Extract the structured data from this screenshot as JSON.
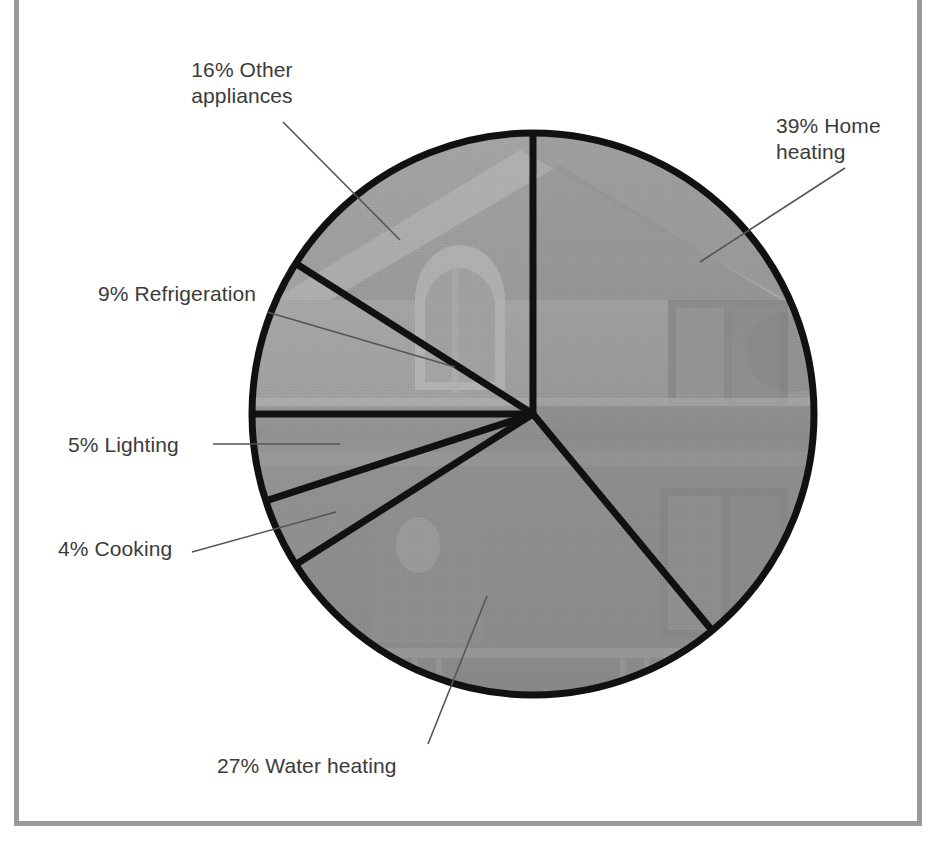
{
  "figure": {
    "background_color": "#ffffff",
    "frame_color": "#9a9a9a",
    "pie_outline_color": "#111111",
    "label_color": "#3b3b3b",
    "leader_line_color": "#555555",
    "image_fill_description": "grayscale photograph of a two-story house visible through the pie"
  },
  "chart_data": {
    "type": "pie",
    "title": "",
    "subtitle": "",
    "xlabel": "",
    "ylabel": "",
    "grid": false,
    "legend_position": "callout-labels",
    "units": "percent",
    "total": 100,
    "categories": [
      "Home heating",
      "Water heating",
      "Cooking",
      "Lighting",
      "Refrigeration",
      "Other appliances"
    ],
    "values": [
      39,
      27,
      4,
      5,
      9,
      16
    ],
    "slices": [
      {
        "label": "Home heating",
        "percent": 39,
        "display": "39% Home heating",
        "start_angle_deg": 0,
        "end_angle_deg": 140.4,
        "shade": "#8e8e8e"
      },
      {
        "label": "Water heating",
        "percent": 27,
        "display": "27% Water heating",
        "start_angle_deg": 140.4,
        "end_angle_deg": 237.6,
        "shade": "#949494"
      },
      {
        "label": "Cooking",
        "percent": 4,
        "display": "4% Cooking",
        "start_angle_deg": 237.6,
        "end_angle_deg": 252.0,
        "shade": "#9b9b9b"
      },
      {
        "label": "Lighting",
        "percent": 5,
        "display": "5% Lighting",
        "start_angle_deg": 252.0,
        "end_angle_deg": 270.0,
        "shade": "#a2a2a2"
      },
      {
        "label": "Refrigeration",
        "percent": 9,
        "display": "9% Refrigeration",
        "start_angle_deg": 270.0,
        "end_angle_deg": 302.4,
        "shade": "#a8a8a8"
      },
      {
        "label": "Other appliances",
        "percent": 16,
        "display": "16% Other appliances",
        "start_angle_deg": 302.4,
        "end_angle_deg": 360.0,
        "shade": "#9f9f9f"
      }
    ]
  },
  "labels": {
    "other_appliances": "16% Other\nappliances",
    "home_heating": "39% Home\nheating",
    "refrigeration": "9% Refrigeration",
    "lighting": "5% Lighting",
    "cooking": "4% Cooking",
    "water_heating": "27% Water heating"
  }
}
